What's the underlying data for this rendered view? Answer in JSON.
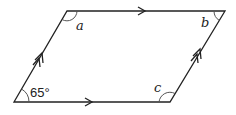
{
  "diagram": {
    "type": "parallelogram",
    "vertices": {
      "bottom_left": [
        14,
        102
      ],
      "top_left": [
        67,
        11
      ],
      "top_right": [
        225,
        11
      ],
      "bottom_right": [
        170,
        102
      ]
    },
    "stroke_color": "#222222",
    "arc_color": "#555555",
    "labels": {
      "bottom_left_angle": "65°",
      "top_left_angle": "a",
      "top_right_angle": "b",
      "bottom_right_angle": "c"
    },
    "parallel_marks": {
      "horizontal_sides": "single arrow",
      "slanted_sides": "double arrow"
    }
  }
}
